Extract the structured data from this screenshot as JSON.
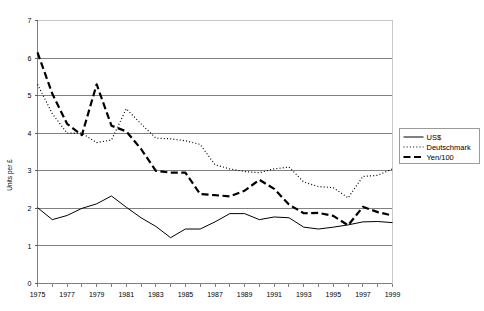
{
  "chart_data": {
    "type": "line",
    "title": "",
    "subtitle": "",
    "xlabel": "",
    "ylabel": "Units per £",
    "xlim": [
      1975,
      1999
    ],
    "ylim": [
      0,
      7
    ],
    "grid": true,
    "grid_axis": "y",
    "legend_position": "right",
    "x": [
      1975,
      1976,
      1977,
      1978,
      1979,
      1980,
      1981,
      1982,
      1983,
      1984,
      1985,
      1986,
      1987,
      1988,
      1989,
      1990,
      1991,
      1992,
      1993,
      1994,
      1995,
      1996,
      1997,
      1998,
      1999
    ],
    "ytick_labels": [
      "0",
      "1",
      "2",
      "3",
      "4",
      "5",
      "6",
      "7"
    ],
    "ytick_values": [
      0,
      1,
      2,
      3,
      4,
      5,
      6,
      7
    ],
    "xtick_labels": [
      "1975",
      "1977",
      "1979",
      "1981",
      "1983",
      "1985",
      "1987",
      "1989",
      "1991",
      "1993",
      "1995",
      "1997",
      "1999"
    ],
    "xtick_values": [
      1975,
      1977,
      1979,
      1981,
      1983,
      1985,
      1987,
      1989,
      1991,
      1993,
      1995,
      1997,
      1999
    ],
    "series": [
      {
        "name": "US$",
        "style": "solid",
        "color": "#000000",
        "values": [
          2.02,
          1.7,
          1.81,
          2.0,
          2.12,
          2.33,
          2.03,
          1.75,
          1.52,
          1.22,
          1.45,
          1.45,
          1.64,
          1.86,
          1.86,
          1.7,
          1.77,
          1.75,
          1.5,
          1.45,
          1.5,
          1.56,
          1.64,
          1.65,
          1.62
        ]
      },
      {
        "name": "Deutschmark",
        "style": "dotted",
        "color": "#000000",
        "values": [
          5.3,
          4.52,
          4.0,
          4.0,
          3.75,
          3.82,
          4.65,
          4.25,
          3.87,
          3.85,
          3.8,
          3.7,
          3.16,
          3.05,
          2.98,
          2.95,
          3.05,
          3.1,
          2.7,
          2.58,
          2.55,
          2.28,
          2.85,
          2.88,
          3.05
        ]
      },
      {
        "name": "Yen/100",
        "style": "dashed",
        "color": "#000000",
        "values": [
          6.15,
          5.05,
          4.25,
          3.95,
          5.3,
          4.2,
          4.05,
          3.58,
          3.0,
          2.95,
          2.95,
          2.38,
          2.35,
          2.32,
          2.47,
          2.76,
          2.52,
          2.1,
          1.87,
          1.88,
          1.8,
          1.55,
          2.04,
          1.9,
          1.81
        ]
      }
    ]
  },
  "legend": {
    "items": [
      {
        "label": "US$",
        "style": "solid"
      },
      {
        "label": "Deutschmark",
        "style": "dotted"
      },
      {
        "label": "Yen/100",
        "style": "dashed"
      }
    ]
  }
}
